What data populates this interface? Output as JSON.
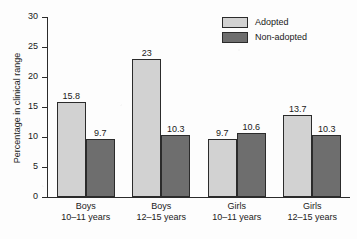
{
  "chart_data": {
    "type": "bar",
    "title": "",
    "subtitle": "",
    "xlabel": "",
    "ylabel": "Percentage in clinical range",
    "ylim": [
      0,
      30
    ],
    "yticks": [
      0,
      5,
      10,
      15,
      20,
      25,
      30
    ],
    "ytick_labels": [
      "0",
      "5",
      "10",
      "15",
      "20",
      "25",
      "30"
    ],
    "grid": false,
    "legend_position": "top-right",
    "categories": [
      "Boys\n10–11 years",
      "Boys\n12–15 years",
      "Girls\n10–11 years",
      "Girls\n12–15 years"
    ],
    "category_lines": [
      {
        "line1": "Boys",
        "line2": "10–11 years"
      },
      {
        "line1": "Boys",
        "line2": "12–15 years"
      },
      {
        "line1": "Girls",
        "line2": "10–11 years"
      },
      {
        "line1": "Girls",
        "line2": "12–15 years"
      }
    ],
    "series": [
      {
        "name": "Adopted",
        "color": "#d2d2d2",
        "values": [
          15.8,
          23,
          9.7,
          13.7
        ],
        "labels": [
          "15.8",
          "23",
          "9.7",
          "13.7"
        ]
      },
      {
        "name": "Non-adopted",
        "color": "#6e6e6e",
        "values": [
          9.7,
          10.3,
          10.6,
          10.3
        ],
        "labels": [
          "9.7",
          "10.3",
          "10.6",
          "10.3"
        ]
      }
    ]
  },
  "legend": {
    "items": [
      {
        "label": "Adopted",
        "color": "#d2d2d2"
      },
      {
        "label": "Non-adopted",
        "color": "#6e6e6e"
      }
    ]
  },
  "axes": {
    "y_title": "Percentage in clinical range",
    "y_tick_labels": [
      "30",
      "25",
      "20",
      "15",
      "10",
      "5",
      "0"
    ]
  }
}
